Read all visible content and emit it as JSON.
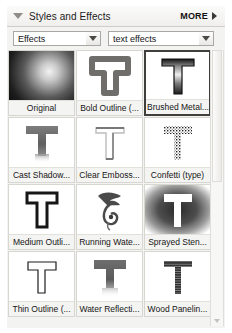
{
  "palette": {
    "title": "Styles and Effects",
    "more_label": "MORE",
    "collapse_icon": "triangle-down-icon",
    "more_icon": "triangle-right-icon"
  },
  "filters": {
    "category": {
      "value": "Effects",
      "placeholder": "Effects"
    },
    "subcategory": {
      "value": "text effects",
      "placeholder": "text effects"
    }
  },
  "grid": {
    "columns": 3,
    "selected_index": 2,
    "items": [
      {
        "label": "Original",
        "art": "apple-photo",
        "selected": false
      },
      {
        "label": "Bold Outline (...",
        "art": "bold-outline-t",
        "selected": false
      },
      {
        "label": "Brushed Metal...",
        "art": "brushed-metal-t",
        "selected": true
      },
      {
        "label": "Cast Shadow...",
        "art": "cast-shadow-t",
        "selected": false
      },
      {
        "label": "Clear Emboss...",
        "art": "clear-emboss-t",
        "selected": false
      },
      {
        "label": "Confetti (type)",
        "art": "confetti-t",
        "selected": false
      },
      {
        "label": "Medium Outli...",
        "art": "medium-outline-t",
        "selected": false
      },
      {
        "label": "Running Wate...",
        "art": "running-water-t",
        "selected": false
      },
      {
        "label": "Sprayed Sten...",
        "art": "sprayed-stencil-t",
        "selected": false
      },
      {
        "label": "Thin Outline (...",
        "art": "thin-outline-t",
        "selected": false
      },
      {
        "label": "Water Reflecti...",
        "art": "water-reflection-t",
        "selected": false
      },
      {
        "label": "Wood Panelin...",
        "art": "wood-paneling-t",
        "selected": false
      }
    ]
  },
  "scrollbar": {
    "up_icon": "scroll-up-arrow-icon",
    "down_icon": "scroll-down-arrow-icon"
  },
  "colors": {
    "panel_bg": "#f3f3f1",
    "cell_border": "#d8d6d1",
    "selection_border": "#403f3c",
    "text": "#161616"
  }
}
